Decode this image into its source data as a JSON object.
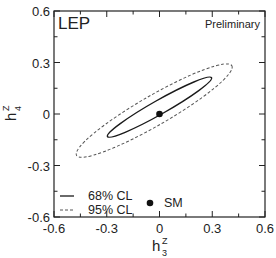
{
  "chart_data": {
    "type": "scatter",
    "title": "",
    "xlabel": "h3^Z",
    "ylabel": "h4^Z",
    "xlabel_main": "h",
    "xlabel_sup": "Z",
    "xlabel_sub": "3",
    "ylabel_main": "h",
    "ylabel_sup": "Z",
    "ylabel_sub": "4",
    "xlim": [
      -0.6,
      0.6
    ],
    "ylim": [
      -0.6,
      0.6
    ],
    "xticks": [
      -0.6,
      -0.3,
      0,
      0.3,
      0.6
    ],
    "yticks": [
      -0.6,
      -0.3,
      0,
      0.3,
      0.6
    ],
    "xtick_labels": [
      "-0.6",
      "-0.3",
      "0",
      "0.3",
      "0.6"
    ],
    "ytick_labels": [
      "-0.6",
      "-0.3",
      "0",
      "0.3",
      "0.6"
    ],
    "minor_ticks_step": 0.15,
    "grid": false,
    "annotations": {
      "experiment": "LEP",
      "status": "Preliminary"
    },
    "contours": [
      {
        "name": "68% CL",
        "style": "solid",
        "center": [
          0.0,
          0.04
        ],
        "semi_major": 0.34,
        "semi_minor": 0.04,
        "angle_deg": 29.5,
        "extent_x": [
          -0.3,
          0.3
        ],
        "extent_y": [
          -0.13,
          0.21
        ]
      },
      {
        "name": "95% CL",
        "style": "dashed",
        "center": [
          -0.03,
          0.02
        ],
        "semi_major": 0.51,
        "semi_minor": 0.085,
        "angle_deg": 30,
        "extent_x": [
          -0.48,
          0.42
        ],
        "extent_y": [
          -0.24,
          0.28
        ]
      }
    ],
    "points": [
      {
        "name": "SM",
        "x": 0,
        "y": 0,
        "marker": "filled-circle"
      }
    ],
    "legend": {
      "position": "lower-left",
      "entries": [
        {
          "label": "68% CL",
          "style": "solid"
        },
        {
          "label": "95% CL",
          "style": "dashed"
        },
        {
          "label": "SM",
          "style": "filled-circle"
        }
      ]
    }
  },
  "colors": {
    "axis": "#222222",
    "line": "#1a1a1a",
    "dashed": "#555555",
    "background": "#ffffff"
  }
}
